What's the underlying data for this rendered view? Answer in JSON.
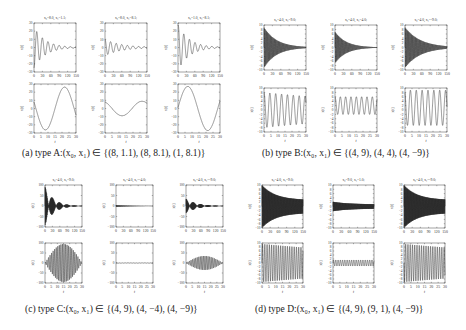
{
  "figure": {
    "subfigures": [
      {
        "id": "a",
        "caption_label": "(a)",
        "caption_text": "type A:(x₀, x₁) ∈ {(8, 1.1), (8, 8.1), (1, 8.1)}",
        "panels": [
          {
            "title": "x₀=8.0, x₁=1.1;"
          },
          {
            "title": "x₀=8.0, x₁=8.1;"
          },
          {
            "title": "x₀=1.0, x₁=8.1;"
          }
        ]
      },
      {
        "id": "b",
        "caption_label": "(b)",
        "caption_text": "type B:(x₀, x₁) ∈ {(4, 9), (4, 4), (4, −9)}",
        "panels": [
          {
            "title": "x₀=4.0, x₁=9.0;"
          },
          {
            "title": "x₀=4.0, x₁=4.0;"
          },
          {
            "title": "x₀=4.0, x₁=-9.0;"
          }
        ]
      },
      {
        "id": "c",
        "caption_label": "(c)",
        "caption_text": "type C:(x₀, x₁) ∈ {(4, 9), (4, −4), (4, −9)}",
        "panels": [
          {
            "title": "x₀=4.0, x₁=9.0;"
          },
          {
            "title": "x₀=4.0, x₁=-4.0;"
          },
          {
            "title": "x₀=4.0, x₁=-9.0;"
          }
        ]
      },
      {
        "id": "d",
        "caption_label": "(d)",
        "caption_text": "type D:(x₀, x₁) ∈ {(4, 9), (9, 1), (4, −9)}",
        "panels": [
          {
            "title": "x₀=4.0, x₁=9.0;"
          },
          {
            "title": "x₀=9.0, x₁=1.0;"
          },
          {
            "title": "x₀=4.0, x₁=-9.0;"
          }
        ]
      }
    ],
    "ylabel": "x(t)",
    "xlabel": "t"
  },
  "chart_data": [
    {
      "id": "a-top",
      "type": "line",
      "xlabel": "",
      "ylabel": "x(t)",
      "xlim": [
        0,
        150
      ],
      "ylim": [
        -30,
        30
      ],
      "xticks": [
        0,
        30,
        60,
        90,
        120,
        150
      ],
      "yticks": [
        -30,
        -20,
        -10,
        0,
        10,
        20,
        30
      ],
      "series": [
        {
          "name": "x0=8.0, x1=1.1",
          "description": "damped oscillation, initial ~-25, peak ~20, decays to ~3 amplitude"
        },
        {
          "name": "x0=8.0, x1=8.1",
          "description": "damped oscillation, starts ~10, small amplitude ~4 decaying"
        },
        {
          "name": "x0=1.0, x1=8.1",
          "description": "damped oscillation, starts ~28, decays to ~3 amplitude"
        }
      ]
    },
    {
      "id": "a-bottom",
      "type": "line",
      "xlabel": "t",
      "ylabel": "x(t)",
      "xlim": [
        0,
        30
      ],
      "ylim": [
        -30,
        30
      ],
      "xticks": [
        0,
        5,
        10,
        15,
        20,
        25,
        30
      ],
      "yticks": [
        -30,
        -20,
        -10,
        0,
        10,
        20,
        30
      ],
      "series": [
        {
          "name": "x0=8.0, x1=1.1",
          "description": "slow sinusoid from 8, min -25 at t~7, max 20 at t~21, -10 at t=30"
        },
        {
          "name": "x0=8.0, x1=8.1",
          "description": "slow sinusoid from 8, min ~-7 at t~13, ~4 at t=30"
        },
        {
          "name": "x0=1.0, x1=8.1",
          "description": "slow sinusoid from 1, max ~27 at t~5, min -22 at t~20, 15 at t=30"
        }
      ]
    },
    {
      "id": "b-top",
      "type": "line",
      "xlabel": "",
      "ylabel": "x(t)",
      "xlim": [
        0,
        150
      ],
      "ylim": [
        -10,
        10
      ],
      "xticks": [
        0,
        30,
        60,
        90,
        120,
        150
      ],
      "yticks": [
        -10,
        -8,
        -6,
        -4,
        -2,
        0,
        2,
        4,
        6,
        8,
        10
      ],
      "series": [
        {
          "name": "x0=4.0, x1=9.0",
          "description": "fast oscillation envelope decaying from ~9 to ~0.5"
        },
        {
          "name": "x0=4.0, x1=4.0",
          "description": "fast oscillation envelope decaying from ~7 to ~0.3"
        },
        {
          "name": "x0=4.0, x1=-9.0",
          "description": "fast oscillation envelope decaying from ~9 to ~1"
        }
      ]
    },
    {
      "id": "b-bottom",
      "type": "line",
      "xlabel": "t",
      "ylabel": "x(t)",
      "xlim": [
        0,
        30
      ],
      "ylim": [
        -10,
        10
      ],
      "xticks": [
        0,
        5,
        10,
        15,
        20,
        25,
        30
      ],
      "yticks": [
        -10,
        -8,
        -6,
        -4,
        -2,
        0,
        2,
        4,
        6,
        8,
        10
      ],
      "series": [
        {
          "name": "x0=4.0, x1=9.0",
          "description": "oscillation amplitude ~8 decaying slightly, ~7 periods"
        },
        {
          "name": "x0=4.0, x1=4.0",
          "description": "oscillation between ~-2 and ~6, ~8 periods"
        },
        {
          "name": "x0=4.0, x1=-9.0",
          "description": "oscillation amplitude ~8, ~7 periods"
        }
      ]
    },
    {
      "id": "c-top",
      "type": "line",
      "xlabel": "",
      "ylabel": "x(t)",
      "xlim": [
        0,
        150
      ],
      "ylim": [
        -100,
        100
      ],
      "xticks": [
        0,
        30,
        60,
        90,
        120,
        150
      ],
      "yticks": [
        -100,
        -50,
        0,
        50,
        100
      ],
      "series": [
        {
          "name": "x0=4.0, x1=9.0",
          "description": "beating oscillation, lobes peaking ~95, 50, 35, 20, 10 decaying"
        },
        {
          "name": "x0=4.0, x1=-4.0",
          "description": "near zero, amplitude ~3"
        },
        {
          "name": "x0=4.0, x1=-9.0",
          "description": "beating oscillation, lobes peaking ~35, 25, 15, 10"
        }
      ]
    },
    {
      "id": "c-bottom",
      "type": "line",
      "xlabel": "t",
      "ylabel": "x(t)",
      "xlim": [
        0,
        30
      ],
      "ylim": [
        -100,
        100
      ],
      "xticks": [
        0,
        5,
        10,
        15,
        20,
        25,
        30
      ],
      "yticks": [
        -100,
        -50,
        0,
        50,
        100
      ],
      "series": [
        {
          "name": "x0=4.0, x1=9.0",
          "description": "single beat envelope, amplitude peaking ~95 at t~15"
        },
        {
          "name": "x0=4.0, x1=-4.0",
          "description": "flat near 0"
        },
        {
          "name": "x0=4.0, x1=-9.0",
          "description": "single beat envelope, amplitude peaking ~35 at t~15"
        }
      ]
    },
    {
      "id": "d-top",
      "type": "line",
      "xlabel": "",
      "ylabel": "x(t)",
      "xlim": [
        0,
        150
      ],
      "ylim": [
        -10,
        10
      ],
      "xticks": [
        0,
        30,
        60,
        90,
        120,
        150
      ],
      "yticks": [
        -10,
        -8,
        -6,
        -4,
        -2,
        0,
        2,
        4,
        6,
        8,
        10
      ],
      "series": [
        {
          "name": "x0=4.0, x1=9.0",
          "description": "dense oscillation envelope decaying from ~10 to ~3"
        },
        {
          "name": "x0=9.0, x1=1.0",
          "description": "dense oscillation envelope ~2 decaying to ~1"
        },
        {
          "name": "x0=4.0, x1=-9.0",
          "description": "dense oscillation envelope decaying from ~10 to ~3"
        }
      ]
    },
    {
      "id": "d-bottom",
      "type": "line",
      "xlabel": "t",
      "ylabel": "x(t)",
      "xlim": [
        0,
        30
      ],
      "ylim": [
        -10,
        10
      ],
      "xticks": [
        0,
        5,
        10,
        15,
        20,
        25,
        30
      ],
      "yticks": [
        -10,
        -8,
        -6,
        -4,
        -2,
        0,
        2,
        4,
        6,
        8,
        10
      ],
      "series": [
        {
          "name": "x0=4.0, x1=9.0",
          "description": "fast oscillation amplitude ~9.5 decaying to ~8, ~18 periods"
        },
        {
          "name": "x0=9.0, x1=1.0",
          "description": "fast oscillation amplitude ~1.5, ~18 periods"
        },
        {
          "name": "x0=4.0, x1=-9.0",
          "description": "fast oscillation amplitude ~9.5 decaying to ~8, ~18 periods"
        }
      ]
    }
  ]
}
